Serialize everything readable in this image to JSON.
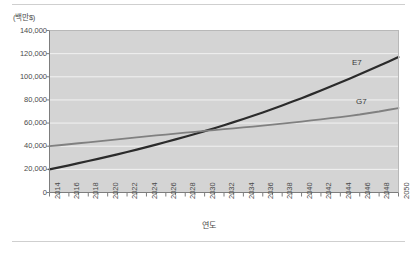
{
  "figure": {
    "unit_label": "(백만$)",
    "xaxis_title": "연도",
    "separator_color": "#cfcfcf",
    "plot_background": "#d4d4d4",
    "gridline_color": "#f2f2f2",
    "axis_color": "#7d7d7d"
  },
  "chart_data": {
    "type": "line",
    "title": "",
    "subtitle": "",
    "xlabel": "연도",
    "ylabel": "(백만$)",
    "grid": true,
    "legend_position": "inline-end-of-line",
    "xlim": [
      2014,
      2050
    ],
    "ylim": [
      0,
      140000
    ],
    "yticks": [
      0,
      20000,
      40000,
      60000,
      80000,
      100000,
      120000,
      140000
    ],
    "ytick_labels": [
      "0",
      "20,000",
      "40,000",
      "60,000",
      "80,000",
      "100,000",
      "120,000",
      "140,000"
    ],
    "x": [
      2014,
      2016,
      2018,
      2020,
      2022,
      2024,
      2026,
      2028,
      2030,
      2032,
      2034,
      2036,
      2038,
      2040,
      2042,
      2044,
      2046,
      2048,
      2050
    ],
    "xtick_labels": [
      "2014",
      "2016",
      "2018",
      "2020",
      "2022",
      "2024",
      "2026",
      "2028",
      "2030",
      "2032",
      "2034",
      "2036",
      "2038",
      "2040",
      "2042",
      "2044",
      "2046",
      "2048",
      "2050"
    ],
    "annotations": [
      {
        "text": "E7",
        "x": 2046,
        "y": 105000
      },
      {
        "text": "G7",
        "x": 2046,
        "y": 68000
      }
    ],
    "series": [
      {
        "name": "E7",
        "color": "#2b2b2b",
        "width": 2.2,
        "values": [
          20000,
          23500,
          27200,
          31000,
          35000,
          39200,
          43600,
          48200,
          53000,
          58100,
          63500,
          69200,
          75200,
          81500,
          88100,
          95000,
          102200,
          109500,
          117000
        ]
      },
      {
        "name": "G7",
        "color": "#808080",
        "width": 1.8,
        "values": [
          40000,
          41700,
          43400,
          45100,
          46800,
          48500,
          50100,
          51700,
          53200,
          54700,
          56200,
          57800,
          59500,
          61300,
          63200,
          65200,
          67400,
          70000,
          73000
        ]
      }
    ]
  }
}
